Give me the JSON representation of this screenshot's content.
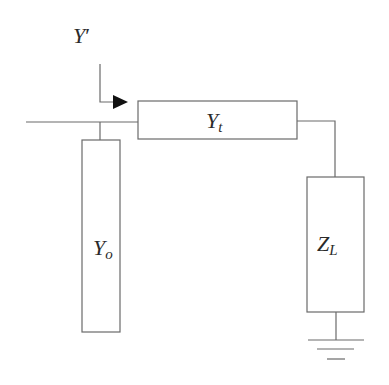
{
  "diagram": {
    "type": "transmission-line-stub-circuit",
    "labels": {
      "input_admittance": {
        "base": "Y",
        "suffix": "′"
      },
      "line": {
        "base": "Y",
        "sub": "t"
      },
      "stub": {
        "base": "Y",
        "sub": "o"
      },
      "load": {
        "base": "Z",
        "sub": "L"
      }
    },
    "colors": {
      "line": "#6a6a6a",
      "text": "#2a2a2a",
      "arrow": "#111111",
      "background": "#ffffff"
    }
  }
}
